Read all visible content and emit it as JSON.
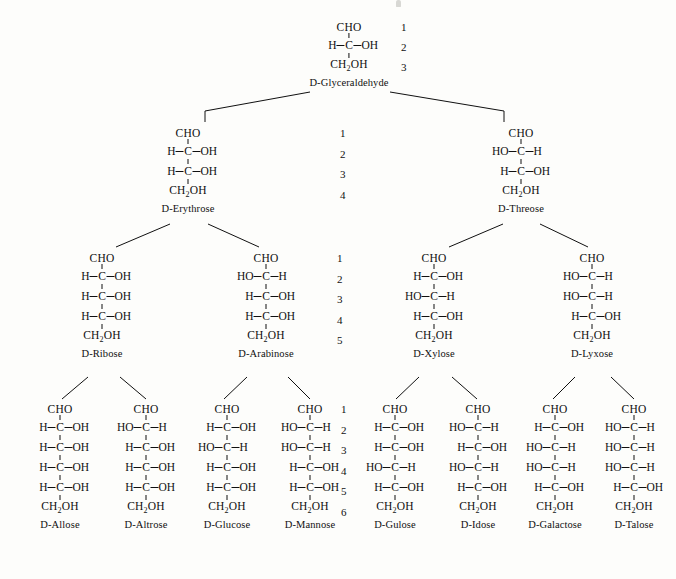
{
  "figure": {
    "cho_label": "CHO",
    "ch2oh_label": "CH",
    "ch2oh_sub": "2",
    "ch2oh_tail": "OH",
    "carbon_label": "C",
    "h_label": "H",
    "oh_label": "OH",
    "ho_label": "HO",
    "line_color": "#101010",
    "background_color": "#fdfdfb"
  },
  "numbering": {
    "triose": [
      "1",
      "2",
      "3"
    ],
    "tetrose": [
      "1",
      "2",
      "3",
      "4"
    ],
    "pentose": [
      "1",
      "2",
      "3",
      "4",
      "5"
    ],
    "hexose": [
      "1",
      "2",
      "3",
      "4",
      "5",
      "6"
    ]
  },
  "levels": [
    {
      "level": "triose",
      "molecules": [
        {
          "name": "D-Glyceraldehyde",
          "centers": [
            "R"
          ],
          "x": 349,
          "y": 22
        }
      ]
    },
    {
      "level": "tetrose",
      "molecules": [
        {
          "name": "D-Erythrose",
          "centers": [
            "R",
            "R"
          ],
          "x": 188,
          "y": 128
        },
        {
          "name": "D-Threose",
          "centers": [
            "L",
            "R"
          ],
          "x": 521,
          "y": 128
        }
      ]
    },
    {
      "level": "pentose",
      "molecules": [
        {
          "name": "D-Ribose",
          "centers": [
            "R",
            "R",
            "R"
          ],
          "x": 102,
          "y": 253
        },
        {
          "name": "D-Arabinose",
          "centers": [
            "L",
            "R",
            "R"
          ],
          "x": 266,
          "y": 253
        },
        {
          "name": "D-Xylose",
          "centers": [
            "R",
            "L",
            "R"
          ],
          "x": 434,
          "y": 253
        },
        {
          "name": "D-Lyxose",
          "centers": [
            "L",
            "L",
            "R"
          ],
          "x": 592,
          "y": 253
        }
      ]
    },
    {
      "level": "hexose",
      "molecules": [
        {
          "name": "D-Allose",
          "centers": [
            "R",
            "R",
            "R",
            "R"
          ],
          "x": 60,
          "y": 404
        },
        {
          "name": "D-Altrose",
          "centers": [
            "L",
            "R",
            "R",
            "R"
          ],
          "x": 146,
          "y": 404
        },
        {
          "name": "D-Glucose",
          "centers": [
            "R",
            "L",
            "R",
            "R"
          ],
          "x": 227,
          "y": 404
        },
        {
          "name": "D-Mannose",
          "centers": [
            "L",
            "L",
            "R",
            "R"
          ],
          "x": 310,
          "y": 404
        },
        {
          "name": "D-Gulose",
          "centers": [
            "R",
            "R",
            "L",
            "R"
          ],
          "x": 395,
          "y": 404
        },
        {
          "name": "D-Idose",
          "centers": [
            "L",
            "R",
            "L",
            "R"
          ],
          "x": 478,
          "y": 404
        },
        {
          "name": "D-Galactose",
          "centers": [
            "R",
            "L",
            "L",
            "R"
          ],
          "x": 555,
          "y": 404
        },
        {
          "name": "D-Talose",
          "centers": [
            "L",
            "L",
            "L",
            "R"
          ],
          "x": 634,
          "y": 404
        }
      ]
    }
  ],
  "number_columns": [
    {
      "set": "triose",
      "x": 401,
      "y": 22,
      "gap": 20
    },
    {
      "set": "tetrose",
      "x": 340,
      "y": 128,
      "gap": 20.5
    },
    {
      "set": "pentose",
      "x": 337,
      "y": 253,
      "gap": 20.5
    },
    {
      "set": "hexose",
      "x": 341,
      "y": 404,
      "gap": 20.5
    }
  ],
  "connectors": [
    {
      "from": "D-Glyceraldehyde",
      "to": "D-Erythrose",
      "x1": 310,
      "y1": 92,
      "x2": 205,
      "y2": 111,
      "stub": true
    },
    {
      "from": "D-Glyceraldehyde",
      "to": "D-Threose",
      "x1": 390,
      "y1": 92,
      "x2": 504,
      "y2": 111,
      "stub": true
    },
    {
      "from": "D-Erythrose",
      "to": "D-Ribose",
      "x1": 170,
      "y1": 224,
      "x2": 116,
      "y2": 247
    },
    {
      "from": "D-Erythrose",
      "to": "D-Arabinose",
      "x1": 208,
      "y1": 224,
      "x2": 259,
      "y2": 247
    },
    {
      "from": "D-Threose",
      "to": "D-Xylose",
      "x1": 503,
      "y1": 224,
      "x2": 449,
      "y2": 247
    },
    {
      "from": "D-Threose",
      "to": "D-Lyxose",
      "x1": 540,
      "y1": 224,
      "x2": 588,
      "y2": 247
    },
    {
      "from": "D-Ribose",
      "to": "D-Allose",
      "x1": 88,
      "y1": 377,
      "x2": 62,
      "y2": 399
    },
    {
      "from": "D-Ribose",
      "to": "D-Altrose",
      "x1": 120,
      "y1": 377,
      "x2": 146,
      "y2": 399
    },
    {
      "from": "D-Arabinose",
      "to": "D-Glucose",
      "x1": 247,
      "y1": 377,
      "x2": 224,
      "y2": 399
    },
    {
      "from": "D-Arabinose",
      "to": "D-Mannose",
      "x1": 288,
      "y1": 377,
      "x2": 310,
      "y2": 399
    },
    {
      "from": "D-Xylose",
      "to": "D-Gulose",
      "x1": 419,
      "y1": 377,
      "x2": 396,
      "y2": 399
    },
    {
      "from": "D-Xylose",
      "to": "D-Idose",
      "x1": 452,
      "y1": 377,
      "x2": 477,
      "y2": 399
    },
    {
      "from": "D-Lyxose",
      "to": "D-Galactose",
      "x1": 575,
      "y1": 377,
      "x2": 553,
      "y2": 399
    },
    {
      "from": "D-Lyxose",
      "to": "D-Talose",
      "x1": 611,
      "y1": 377,
      "x2": 634,
      "y2": 399
    }
  ]
}
